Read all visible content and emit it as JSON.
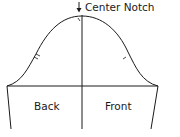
{
  "diagram": {
    "type": "sleeve-pattern",
    "annotation": {
      "label": "Center Notch",
      "icon": "arrow-down-icon"
    },
    "regions": {
      "back": "Back",
      "front": "Front"
    },
    "notches": {
      "back": "double-notch",
      "front": "single-notch",
      "center": "center-notch"
    },
    "colors": {
      "line": "#1a1a1a",
      "background": "#ffffff"
    }
  }
}
